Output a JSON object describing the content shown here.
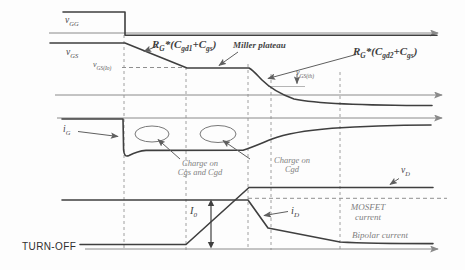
{
  "figure_kind": "turn-off switching waveform diagram",
  "colors": {
    "background": "#fdfdfd",
    "trace": "#3f3f3f",
    "axis": "#8a8a8a",
    "dashed_guides": "#a0a0a0",
    "annotation": "#5f5f5f",
    "muted_text": "#828282"
  },
  "labels_plain": {
    "miller_plateau": "Miller plateau",
    "charge1_line1": "Charge on",
    "charge1_line2": "Cgs and Cgd",
    "charge2_line1": "Charge on",
    "charge2_line2": "Cgd",
    "mosfet_line1": "MOSFET",
    "mosfet_line2": "current",
    "bipolar": "Bipolar current",
    "turnoff": "TURN-OFF"
  },
  "labels_rich": {
    "vgg": [
      [
        "v",
        0
      ],
      [
        "GG",
        1
      ]
    ],
    "vgs": [
      [
        "v",
        0
      ],
      [
        "GS",
        1
      ]
    ],
    "vgsio": [
      [
        "v",
        0
      ],
      [
        "GS(Io)",
        1
      ]
    ],
    "rg1": [
      [
        "R",
        0
      ],
      [
        "G",
        1
      ],
      [
        "*(C",
        0
      ],
      [
        "gd1",
        1
      ],
      [
        "+C",
        0
      ],
      [
        "gs",
        1
      ],
      [
        ")",
        0
      ]
    ],
    "rg2": [
      [
        "R",
        0
      ],
      [
        "G",
        1
      ],
      [
        "*(C",
        0
      ],
      [
        "gd2",
        1
      ],
      [
        "+C",
        0
      ],
      [
        "gs",
        1
      ],
      [
        ")",
        0
      ]
    ],
    "vgsth": [
      [
        "v",
        0
      ],
      [
        "GS(th)",
        1
      ]
    ],
    "ig": [
      [
        "i",
        0
      ],
      [
        "G",
        1
      ]
    ],
    "vd": [
      [
        "v",
        0
      ],
      [
        "D",
        1
      ]
    ],
    "i0": [
      [
        "I",
        0
      ],
      [
        "0",
        1
      ]
    ],
    "id": [
      [
        "i",
        0
      ],
      [
        "D",
        1
      ]
    ]
  }
}
